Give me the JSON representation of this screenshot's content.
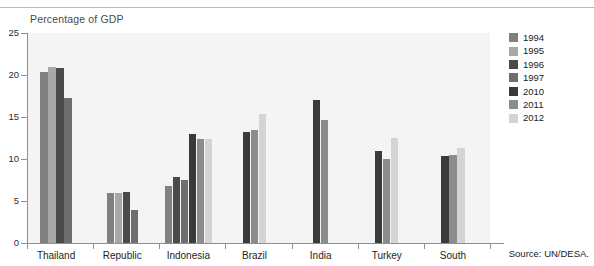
{
  "figure": {
    "clipped_top_text": "",
    "subtitle": "Percentage of GDP",
    "source_note": "Source:  UN/DESA."
  },
  "chart_data": {
    "type": "bar",
    "title": "",
    "subtitle": "Percentage of GDP",
    "xlabel": "",
    "ylabel": "",
    "ylim": [
      0,
      25
    ],
    "yticks": [
      0,
      5,
      10,
      15,
      20,
      25
    ],
    "grid": false,
    "legend_position": "right",
    "categories": [
      "Thailand",
      "Republic",
      "Indonesia",
      "Brazil",
      "India",
      "Turkey",
      "South"
    ],
    "series": [
      {
        "name": "1994",
        "color": "#808080",
        "values": [
          20.4,
          5.9,
          6.8,
          null,
          null,
          null,
          null
        ]
      },
      {
        "name": "1995",
        "color": "#a8a8a8",
        "values": [
          21.0,
          6.0,
          null,
          null,
          null,
          null,
          null
        ]
      },
      {
        "name": "1996",
        "color": "#4a4a4a",
        "values": [
          20.8,
          6.1,
          7.8,
          null,
          null,
          null,
          null
        ]
      },
      {
        "name": "1997",
        "color": "#6e6e6e",
        "values": [
          17.3,
          3.9,
          7.5,
          null,
          null,
          null,
          null
        ]
      },
      {
        "name": "2010",
        "color": "#3a3a3a",
        "values": [
          null,
          null,
          13.0,
          13.2,
          17.0,
          10.9,
          10.4
        ]
      },
      {
        "name": "2011",
        "color": "#8c8c8c",
        "values": [
          null,
          null,
          12.4,
          13.5,
          14.7,
          10.0,
          10.5
        ]
      },
      {
        "name": "2012",
        "color": "#d4d4d4",
        "values": [
          null,
          null,
          12.4,
          15.4,
          null,
          12.5,
          11.3
        ]
      }
    ]
  },
  "legend": {
    "items": [
      {
        "label": "1994",
        "color": "#808080"
      },
      {
        "label": "1995",
        "color": "#a8a8a8"
      },
      {
        "label": "1996",
        "color": "#4a4a4a"
      },
      {
        "label": "1997",
        "color": "#6e6e6e"
      },
      {
        "label": "2010",
        "color": "#3a3a3a"
      },
      {
        "label": "2011",
        "color": "#8c8c8c"
      },
      {
        "label": "2012",
        "color": "#d4d4d4"
      }
    ]
  },
  "axes": {
    "y_tick_labels": [
      "25",
      "20",
      "15",
      "10",
      "5",
      "0"
    ],
    "x_tick_labels": [
      "Thailand",
      "Republic",
      "Indonesia",
      "Brazil",
      "India",
      "Turkey",
      "South"
    ]
  },
  "colors": {
    "plot_background": "#f4f4f4",
    "axis": "#8f8f8f",
    "text": "#1e1e1e"
  }
}
